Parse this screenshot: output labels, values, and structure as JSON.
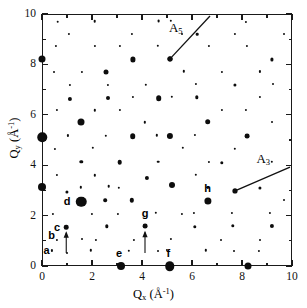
{
  "chart_data": {
    "type": "scatter",
    "title": "",
    "subtitle": "",
    "xlabel": "Q_x (A^-1)",
    "ylabel": "Q_y (A^-1)",
    "xlabel_parts": {
      "base": "Q",
      "sub": "x",
      "unit_open": " (Å",
      "unit_sup": "-1",
      "unit_close": ")"
    },
    "ylabel_parts": {
      "base": "Q",
      "sub": "y",
      "unit_open": " (Å",
      "unit_sup": "-1",
      "unit_close": ")"
    },
    "xlim": [
      0,
      10
    ],
    "ylim": [
      0,
      10
    ],
    "xticks": [
      0,
      2,
      4,
      6,
      8,
      10
    ],
    "yticks": [
      0,
      2,
      4,
      6,
      8,
      10
    ],
    "xtick_labels": [
      "0",
      "2",
      "4",
      "6",
      "8",
      "10"
    ],
    "ytick_labels": [
      "0",
      "2",
      "4",
      "6",
      "8",
      "10"
    ],
    "minor_ticks_per_interval": 1,
    "grid": false,
    "legend": false,
    "marker_color": "#0d0d0d",
    "frame_color": "#1a1a1a",
    "background": "#ffffff",
    "size_scale_note": "size field is rendered marker diameter in px",
    "points": [
      {
        "x": 0.0,
        "y": 8.23,
        "size": 7.0
      },
      {
        "x": 0.0,
        "y": 5.1,
        "size": 9.5
      },
      {
        "x": 0.0,
        "y": 3.15,
        "size": 8.0
      },
      {
        "x": 3.15,
        "y": 0.0,
        "size": 8.0
      },
      {
        "x": 5.1,
        "y": 0.0,
        "size": 9.5
      },
      {
        "x": 8.23,
        "y": 0.0,
        "size": 7.0
      },
      {
        "x": 1.57,
        "y": 2.55,
        "size": 10.5
      },
      {
        "x": 0.97,
        "y": 1.54,
        "size": 4.6
      },
      {
        "x": 4.12,
        "y": 1.58,
        "size": 4.8
      },
      {
        "x": 6.63,
        "y": 2.57,
        "size": 7.2
      },
      {
        "x": 1.57,
        "y": 5.7,
        "size": 7.0
      },
      {
        "x": 2.57,
        "y": 7.68,
        "size": 5.0
      },
      {
        "x": 3.62,
        "y": 8.2,
        "size": 5.2
      },
      {
        "x": 5.12,
        "y": 8.2,
        "size": 5.0
      },
      {
        "x": 1.57,
        "y": 4.14,
        "size": 3.4
      },
      {
        "x": 3.1,
        "y": 4.12,
        "size": 4.6
      },
      {
        "x": 4.18,
        "y": 3.48,
        "size": 4.2
      },
      {
        "x": 5.18,
        "y": 3.2,
        "size": 6.0
      },
      {
        "x": 3.62,
        "y": 5.16,
        "size": 5.6
      },
      {
        "x": 5.12,
        "y": 5.16,
        "size": 6.2
      },
      {
        "x": 6.63,
        "y": 5.72,
        "size": 5.6
      },
      {
        "x": 8.2,
        "y": 5.16,
        "size": 4.8
      },
      {
        "x": 1.12,
        "y": 6.63,
        "size": 4.2
      },
      {
        "x": 2.62,
        "y": 6.65,
        "size": 4.0
      },
      {
        "x": 4.66,
        "y": 6.66,
        "size": 5.6
      },
      {
        "x": 1.0,
        "y": 2.94,
        "size": 3.2
      },
      {
        "x": 2.52,
        "y": 2.62,
        "size": 3.6
      },
      {
        "x": 2.6,
        "y": 1.58,
        "size": 3.4
      },
      {
        "x": 3.6,
        "y": 2.6,
        "size": 4.4
      },
      {
        "x": 6.1,
        "y": 1.56,
        "size": 3.4
      },
      {
        "x": 7.62,
        "y": 1.6,
        "size": 3.4
      },
      {
        "x": 9.18,
        "y": 1.6,
        "size": 4.2
      },
      {
        "x": 7.18,
        "y": 4.1,
        "size": 3.4
      },
      {
        "x": 8.7,
        "y": 3.1,
        "size": 3.2
      },
      {
        "x": 6.2,
        "y": 6.7,
        "size": 3.4
      },
      {
        "x": 7.7,
        "y": 7.2,
        "size": 3.2
      },
      {
        "x": 9.2,
        "y": 8.2,
        "size": 3.2
      },
      {
        "x": 0.62,
        "y": 9.7,
        "size": 2.6
      },
      {
        "x": 2.1,
        "y": 9.72,
        "size": 2.6
      },
      {
        "x": 4.66,
        "y": 9.72,
        "size": 2.8
      },
      {
        "x": 6.2,
        "y": 9.2,
        "size": 2.6
      },
      {
        "x": 0.4,
        "y": 0.62,
        "size": 2.2
      },
      {
        "x": 1.96,
        "y": 0.62,
        "size": 2.4
      },
      {
        "x": 3.48,
        "y": 0.6,
        "size": 2.4
      },
      {
        "x": 5.0,
        "y": 0.64,
        "size": 2.2
      },
      {
        "x": 6.54,
        "y": 0.62,
        "size": 2.4
      },
      {
        "x": 8.66,
        "y": 0.6,
        "size": 2.2
      },
      {
        "x": 0.58,
        "y": 1.02,
        "size": 2.2
      },
      {
        "x": 2.14,
        "y": 1.04,
        "size": 2.2
      },
      {
        "x": 3.66,
        "y": 1.04,
        "size": 2.2
      },
      {
        "x": 5.16,
        "y": 1.06,
        "size": 2.2
      },
      {
        "x": 7.16,
        "y": 1.02,
        "size": 2.0
      },
      {
        "x": 8.7,
        "y": 1.04,
        "size": 2.0
      },
      {
        "x": 0.44,
        "y": 2.06,
        "size": 2.2
      },
      {
        "x": 1.98,
        "y": 2.08,
        "size": 2.2
      },
      {
        "x": 3.02,
        "y": 2.08,
        "size": 2.2
      },
      {
        "x": 4.56,
        "y": 2.12,
        "size": 2.4
      },
      {
        "x": 6.08,
        "y": 2.1,
        "size": 2.2
      },
      {
        "x": 7.6,
        "y": 2.12,
        "size": 2.2
      },
      {
        "x": 9.12,
        "y": 2.1,
        "size": 2.2
      },
      {
        "x": 0.58,
        "y": 3.62,
        "size": 2.2
      },
      {
        "x": 2.1,
        "y": 3.6,
        "size": 2.4
      },
      {
        "x": 2.66,
        "y": 3.16,
        "size": 2.6
      },
      {
        "x": 4.64,
        "y": 4.14,
        "size": 2.6
      },
      {
        "x": 6.16,
        "y": 3.62,
        "size": 2.4
      },
      {
        "x": 7.7,
        "y": 4.66,
        "size": 2.4
      },
      {
        "x": 9.2,
        "y": 4.14,
        "size": 2.4
      },
      {
        "x": 0.52,
        "y": 4.66,
        "size": 2.2
      },
      {
        "x": 2.04,
        "y": 4.68,
        "size": 2.4
      },
      {
        "x": 4.1,
        "y": 5.7,
        "size": 2.4
      },
      {
        "x": 5.64,
        "y": 4.68,
        "size": 2.4
      },
      {
        "x": 6.66,
        "y": 4.14,
        "size": 2.2
      },
      {
        "x": 8.16,
        "y": 6.2,
        "size": 2.2
      },
      {
        "x": 0.6,
        "y": 6.18,
        "size": 2.2
      },
      {
        "x": 2.1,
        "y": 6.18,
        "size": 2.4
      },
      {
        "x": 3.12,
        "y": 6.2,
        "size": 2.2
      },
      {
        "x": 5.18,
        "y": 6.72,
        "size": 2.4
      },
      {
        "x": 7.18,
        "y": 6.18,
        "size": 2.2
      },
      {
        "x": 8.7,
        "y": 6.7,
        "size": 2.2
      },
      {
        "x": 1.1,
        "y": 7.2,
        "size": 2.2
      },
      {
        "x": 2.62,
        "y": 7.18,
        "size": 2.2
      },
      {
        "x": 4.14,
        "y": 7.2,
        "size": 2.4
      },
      {
        "x": 5.66,
        "y": 7.72,
        "size": 2.4
      },
      {
        "x": 7.18,
        "y": 7.7,
        "size": 2.2
      },
      {
        "x": 8.7,
        "y": 7.72,
        "size": 2.2
      },
      {
        "x": 0.56,
        "y": 8.72,
        "size": 2.2
      },
      {
        "x": 2.1,
        "y": 8.74,
        "size": 2.2
      },
      {
        "x": 3.12,
        "y": 8.72,
        "size": 2.2
      },
      {
        "x": 4.64,
        "y": 8.74,
        "size": 2.4
      },
      {
        "x": 6.68,
        "y": 8.72,
        "size": 2.2
      },
      {
        "x": 8.2,
        "y": 8.72,
        "size": 2.2
      },
      {
        "x": 1.06,
        "y": 9.2,
        "size": 2.2
      },
      {
        "x": 3.6,
        "y": 9.22,
        "size": 2.2
      },
      {
        "x": 7.7,
        "y": 9.2,
        "size": 2.2
      },
      {
        "x": 5.14,
        "y": 9.72,
        "size": 2.4
      },
      {
        "x": 8.16,
        "y": 9.7,
        "size": 2.2
      },
      {
        "x": 1.6,
        "y": 1.06,
        "size": 2.0
      },
      {
        "x": 4.62,
        "y": 0.6,
        "size": 2.0
      },
      {
        "x": 1.54,
        "y": 3.12,
        "size": 2.4
      },
      {
        "x": 3.08,
        "y": 3.1,
        "size": 2.4
      },
      {
        "x": 5.6,
        "y": 2.06,
        "size": 2.2
      },
      {
        "x": 6.62,
        "y": 3.12,
        "size": 2.2
      },
      {
        "x": 2.56,
        "y": 5.16,
        "size": 2.4
      },
      {
        "x": 4.6,
        "y": 5.18,
        "size": 2.4
      },
      {
        "x": 6.12,
        "y": 5.2,
        "size": 2.2
      },
      {
        "x": 1.04,
        "y": 5.18,
        "size": 2.2
      },
      {
        "x": 3.64,
        "y": 6.7,
        "size": 2.2
      },
      {
        "x": 1.58,
        "y": 7.7,
        "size": 2.2
      },
      {
        "x": 6.16,
        "y": 7.22,
        "size": 2.2
      },
      {
        "x": 9.22,
        "y": 7.22,
        "size": 2.0
      },
      {
        "x": 9.2,
        "y": 5.7,
        "size": 2.0
      },
      {
        "x": 0.98,
        "y": 0.52,
        "size": 2.0
      },
      {
        "x": 7.66,
        "y": 0.58,
        "size": 2.0
      },
      {
        "x": 9.66,
        "y": 2.6,
        "size": 2.0
      },
      {
        "x": 9.68,
        "y": 9.2,
        "size": 2.0
      },
      {
        "x": 0.46,
        "y": 7.7,
        "size": 2.0
      },
      {
        "x": 5.6,
        "y": 9.2,
        "size": 2.0
      }
    ],
    "point_labels": [
      {
        "id": "a",
        "label": "a",
        "x": 0.18,
        "y": 0.62
      },
      {
        "id": "b",
        "label": "b",
        "x": 0.38,
        "y": 1.22
      },
      {
        "id": "c",
        "label": "c",
        "x": 0.6,
        "y": 1.56
      },
      {
        "id": "d",
        "label": "d",
        "x": 1.0,
        "y": 2.58
      },
      {
        "id": "e",
        "label": "e",
        "x": 3.08,
        "y": 0.5
      },
      {
        "id": "f",
        "label": "f",
        "x": 5.05,
        "y": 0.52
      },
      {
        "id": "g",
        "label": "g",
        "x": 4.12,
        "y": 2.1
      },
      {
        "id": "h",
        "label": "h",
        "x": 6.62,
        "y": 3.08
      }
    ],
    "arrows": [
      {
        "id": "arrow-b",
        "x1": 0.97,
        "y1": 0.52,
        "x2": 0.97,
        "y2": 1.32
      },
      {
        "id": "arrow-g",
        "x1": 4.12,
        "y1": 0.52,
        "x2": 4.12,
        "y2": 1.34
      }
    ],
    "annotations": [
      {
        "id": "A5",
        "base": "A",
        "sub": "5",
        "label_x": 5.35,
        "label_y": 9.45,
        "line_x1": 5.12,
        "line_y1": 8.22,
        "line_x2": 6.72,
        "line_y2": 9.92,
        "dot": true
      },
      {
        "id": "A3",
        "base": "A",
        "sub": "3",
        "label_x": 8.85,
        "label_y": 4.25,
        "line_x1": 7.72,
        "line_y1": 2.98,
        "line_x2": 9.92,
        "line_y2": 3.92,
        "dot": true
      }
    ]
  },
  "axes": {
    "x_title_base": "Q",
    "x_title_sub": "x",
    "x_title_unit_open": " (Å",
    "x_title_unit_sup": "-1",
    "x_title_unit_close": ")",
    "y_title_base": "Q",
    "y_title_sub": "y",
    "y_title_unit_open": " (Å",
    "y_title_unit_sup": "-1",
    "y_title_unit_close": ")"
  }
}
